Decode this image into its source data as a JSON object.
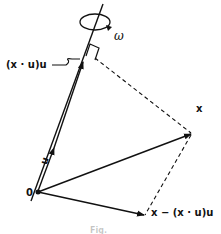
{
  "figure": {
    "labels": {
      "projection": "(x · u)u",
      "omega": "ω",
      "unit_vector": "u",
      "origin": "0",
      "point": "x",
      "perpendicular": "x − (x · u)u"
    },
    "caption": "Fig."
  }
}
